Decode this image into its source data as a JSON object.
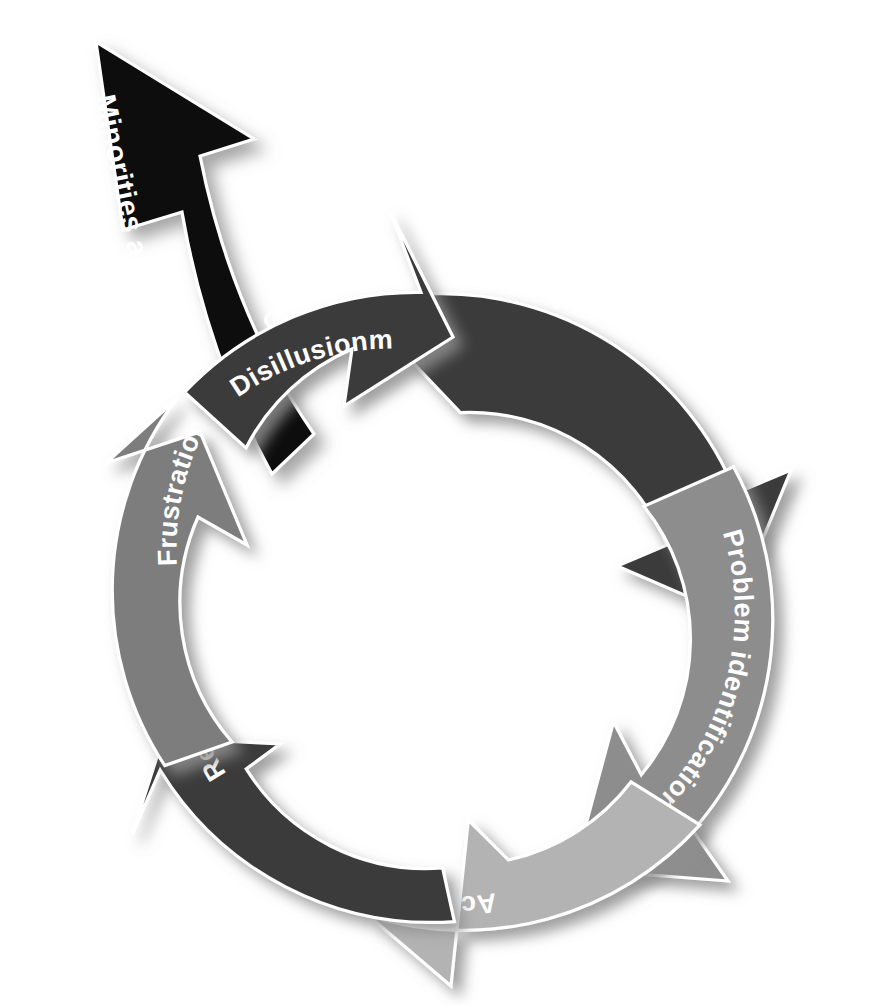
{
  "diagram": {
    "type": "cycle-diagram",
    "direction": "counterclockwise",
    "background_color": "#ffffff",
    "label_color": "#ffffff",
    "segment_outline_color": "#ffffff",
    "shadow_color": "#9a9a9a",
    "center": {
      "x": 440,
      "y": 612
    },
    "outer_radius": 318,
    "inner_radius": 212,
    "segments": [
      {
        "id": "organizational-status-quo",
        "label": "Organizational status quo",
        "color": "#3b3b3b",
        "order": 1,
        "start_angle": -104,
        "end_angle": -22,
        "points_to": "problem-identification"
      },
      {
        "id": "problem-identification",
        "label": "Problem identification",
        "color": "#8d8d8d",
        "order": 2,
        "start_angle": -17,
        "end_angle": 42,
        "points_to": "action"
      },
      {
        "id": "action",
        "label": "Action",
        "color": "#b3b3b3",
        "order": 3,
        "start_angle": 47,
        "end_angle": 104,
        "points_to": "relaxation"
      },
      {
        "id": "relaxation",
        "label": "Relaxation",
        "color": "#3b3b3b",
        "order": 4,
        "start_angle": 110,
        "end_angle": 166,
        "points_to": "frustration"
      },
      {
        "id": "frustration",
        "label": "Frustration",
        "color": "#7d7d7d",
        "order": 5,
        "start_angle": 171,
        "end_angle": 228,
        "points_to": "disillusionment"
      },
      {
        "id": "disillusionment",
        "label": "Disillusionment",
        "color": "#3b3b3b",
        "order": 6,
        "start_angle": 233,
        "end_angle": 284,
        "points_to": "organizational-status-quo"
      }
    ],
    "exit_arrow": {
      "id": "minorities-women-leave",
      "label_line1": "Minorities and women",
      "label_line2": "leave the organization",
      "color": "#0b0b0b",
      "branches_from": "disillusionment",
      "direction": "outward up-left"
    }
  }
}
